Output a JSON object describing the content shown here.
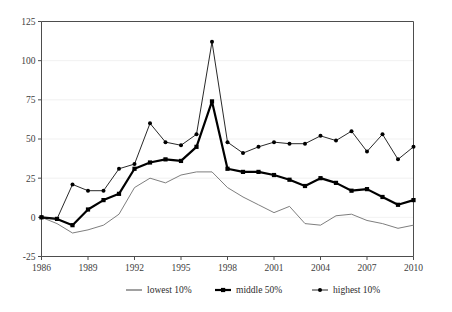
{
  "chart_data": {
    "type": "line",
    "title": "",
    "subtitle": "",
    "xlabel": "",
    "ylabel": "",
    "xlim": [
      1986,
      2010
    ],
    "ylim": [
      -25,
      125
    ],
    "yticks": [
      -25,
      0,
      25,
      50,
      75,
      100,
      125
    ],
    "ytick_labels": [
      "-25",
      "0",
      "25",
      "50",
      "75",
      "100",
      "125"
    ],
    "xticks": [
      1986,
      1989,
      1992,
      1995,
      1998,
      2001,
      2004,
      2007,
      2010
    ],
    "xtick_labels": [
      "1986",
      "1989",
      "1992",
      "1995",
      "1998",
      "2001",
      "2004",
      "2007",
      "2010"
    ],
    "grid": true,
    "grid_axis": "y",
    "legend_position": "bottom",
    "x": [
      1986,
      1987,
      1988,
      1989,
      1990,
      1991,
      1992,
      1993,
      1994,
      1995,
      1996,
      1997,
      1998,
      1999,
      2000,
      2001,
      2002,
      2003,
      2004,
      2005,
      2006,
      2007,
      2008,
      2009,
      2010
    ],
    "series": [
      {
        "name": "lowest 10%",
        "color": "#6f6f6f",
        "marker": "none",
        "line_width": "thin",
        "values": [
          0,
          -4,
          -10,
          -8,
          -5,
          2,
          19,
          25,
          22,
          27,
          29,
          29,
          19,
          13,
          8,
          3,
          7,
          -4,
          -5,
          1,
          2,
          -2,
          -4,
          -7,
          -5
        ]
      },
      {
        "name": "middle 50%",
        "color": "#000000",
        "marker": "square",
        "line_width": "thick",
        "values": [
          0,
          -1,
          -5,
          5,
          11,
          15,
          31,
          35,
          37,
          36,
          45,
          74,
          31,
          29,
          29,
          27,
          24,
          20,
          25,
          22,
          17,
          18,
          13,
          8,
          11
        ]
      },
      {
        "name": "highest 10%",
        "color": "#111111",
        "marker": "circle",
        "line_width": "thin",
        "values": [
          0,
          -1,
          21,
          17,
          17,
          31,
          34,
          60,
          48,
          46,
          53,
          112,
          48,
          41,
          45,
          48,
          47,
          47,
          52,
          49,
          55,
          42,
          53,
          37,
          45
        ]
      }
    ]
  },
  "legend": {
    "items": [
      {
        "label": "lowest 10%"
      },
      {
        "label": "middle 50%"
      },
      {
        "label": "highest 10%"
      }
    ]
  }
}
